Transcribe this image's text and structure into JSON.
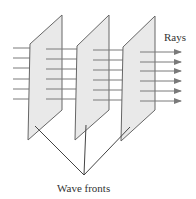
{
  "diagram": {
    "labels": {
      "rays": "Rays",
      "wave_fronts": "Wave fronts"
    },
    "colors": {
      "plane_fill": "#e9e9e9",
      "plane_stroke": "#666666",
      "ray": "#7a7a7a",
      "pointer": "#444444"
    },
    "planes": [
      {
        "name": "wave-front-1"
      },
      {
        "name": "wave-front-2"
      },
      {
        "name": "wave-front-3"
      }
    ],
    "ray_count": 6
  }
}
